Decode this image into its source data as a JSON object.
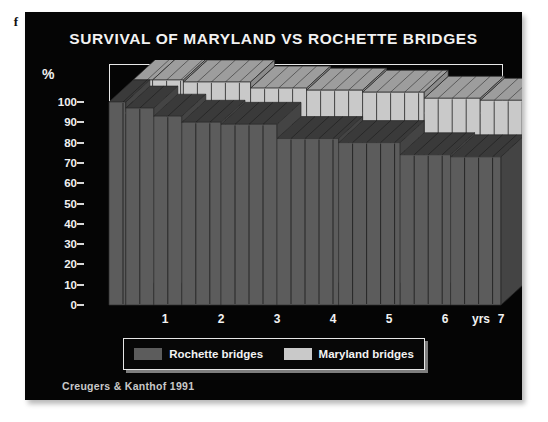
{
  "edge_fragment": "f",
  "panel": {
    "title": "SURVIVAL OF MARYLAND VS ROCHETTE BRIDGES",
    "credit": "Creugers & Kanthof 1991"
  },
  "legend": {
    "items": [
      {
        "label": "Rochette bridges",
        "color": "#5c5c5c"
      },
      {
        "label": "Maryland bridges",
        "color": "#c9c9c9"
      }
    ]
  },
  "colors": {
    "background": "#050505",
    "text": "#f2f2f2",
    "rochette_front": "#5c5c5c",
    "rochette_top": "#3a3a3a",
    "rochette_side": "#444444",
    "maryland_front": "#c9c9c9",
    "maryland_top": "#9d9d9d",
    "maryland_side": "#8c8c8c",
    "frame": "#e8e8e8"
  },
  "chart_data": {
    "type": "area",
    "title": "SURVIVAL OF MARYLAND VS ROCHETTE BRIDGES",
    "subtitle": "Creugers & Kanthof 1991",
    "xlabel": "yrs",
    "ylabel": "%",
    "xlim": [
      0,
      7
    ],
    "ylim": [
      0,
      100
    ],
    "yticks": [
      0,
      10,
      20,
      30,
      40,
      50,
      60,
      70,
      80,
      90,
      100
    ],
    "xticks": [
      1,
      2,
      3,
      4,
      5,
      6,
      7
    ],
    "grid": false,
    "legend_position": "bottom",
    "style": "3d-stepped-survival-curves",
    "series": [
      {
        "name": "Rochette bridges",
        "color": "#5c5c5c",
        "steps": [
          {
            "x_start": 0.0,
            "x_end": 0.3,
            "y": 100
          },
          {
            "x_start": 0.3,
            "x_end": 0.8,
            "y": 97
          },
          {
            "x_start": 0.8,
            "x_end": 1.3,
            "y": 93
          },
          {
            "x_start": 1.3,
            "x_end": 2.0,
            "y": 90
          },
          {
            "x_start": 2.0,
            "x_end": 3.0,
            "y": 89
          },
          {
            "x_start": 3.0,
            "x_end": 4.1,
            "y": 82
          },
          {
            "x_start": 4.1,
            "x_end": 5.2,
            "y": 80
          },
          {
            "x_start": 5.2,
            "x_end": 6.1,
            "y": 74
          },
          {
            "x_start": 6.1,
            "x_end": 7.0,
            "y": 73
          }
        ]
      },
      {
        "name": "Maryland bridges",
        "color": "#c9c9c9",
        "steps": [
          {
            "x_start": 0.0,
            "x_end": 0.35,
            "y": 100
          },
          {
            "x_start": 0.35,
            "x_end": 0.9,
            "y": 100
          },
          {
            "x_start": 0.9,
            "x_end": 2.1,
            "y": 99
          },
          {
            "x_start": 2.1,
            "x_end": 3.1,
            "y": 96
          },
          {
            "x_start": 3.1,
            "x_end": 4.1,
            "y": 95
          },
          {
            "x_start": 4.1,
            "x_end": 5.2,
            "y": 94
          },
          {
            "x_start": 5.2,
            "x_end": 6.2,
            "y": 91
          },
          {
            "x_start": 6.2,
            "x_end": 7.0,
            "y": 90
          }
        ]
      }
    ]
  }
}
